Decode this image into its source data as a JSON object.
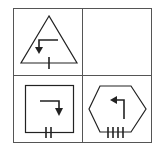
{
  "puzzle": {
    "layout": "2x2 grid",
    "stroke_color": "#222222",
    "grid_color": "#555555",
    "background": "#ffffff",
    "cells": [
      {
        "position": "top-left",
        "shape": "triangle",
        "arrow": "right-then-down (points down, on left)",
        "tick_count": 1
      },
      {
        "position": "top-right",
        "shape": "empty",
        "arrow": "none",
        "tick_count": 0
      },
      {
        "position": "bottom-left",
        "shape": "square",
        "arrow": "left-then-down (points down, on right)",
        "tick_count": 2
      },
      {
        "position": "bottom-right",
        "shape": "hexagon",
        "arrow": "up-then-left (points left)",
        "tick_count": 4
      }
    ]
  }
}
